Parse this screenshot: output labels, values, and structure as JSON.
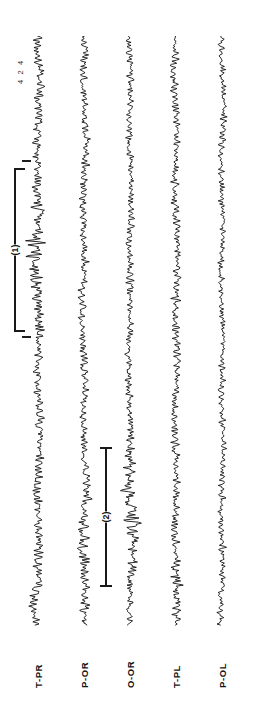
{
  "figure": {
    "name": "polygraphic-eeg-recording",
    "orientation_degrees": 90,
    "background_color": "#ffffff",
    "trace_color": "#121212",
    "annotation_color": "#191919"
  },
  "scale_caption": {
    "text": "4 2 4"
  },
  "channels": [
    {
      "id": "ch1",
      "label": "T-PR",
      "x": 38,
      "seed": 11
    },
    {
      "id": "ch2",
      "label": "P-OR",
      "x": 84,
      "seed": 27
    },
    {
      "id": "ch3",
      "label": "O-OR",
      "x": 130,
      "seed": 43
    },
    {
      "id": "ch4",
      "label": "T-PL",
      "x": 176,
      "seed": 59
    },
    {
      "id": "ch5",
      "label": "P-OL",
      "x": 222,
      "seed": 73
    }
  ],
  "annotations": [
    {
      "id": "m1",
      "text": "(1)",
      "style": "bracket",
      "x": 14,
      "y": 168,
      "length": 164
    },
    {
      "id": "m2",
      "text": "(2)",
      "style": "ibeam",
      "x": 100,
      "y": 447,
      "length": 140
    }
  ],
  "tick_marks": [
    {
      "id": "t1",
      "x": 22,
      "y": 160,
      "width": 9
    },
    {
      "id": "t2",
      "x": 22,
      "y": 336,
      "width": 9
    }
  ],
  "chart_data": {
    "type": "line",
    "title": "",
    "subtitle": "",
    "xlabel": "",
    "ylabel": "",
    "legend_position": "none",
    "grid": false,
    "orientation": "vertical-time-axis",
    "amplitude_scale_label": "4 2 4",
    "series": [
      {
        "name": "T-PR",
        "baseline_x": 38,
        "noise_amplitude": 7.5,
        "burst_regions": [
          {
            "start": 168,
            "end": 332,
            "amplitude": 13,
            "annotation": "(1)"
          },
          {
            "start": 560,
            "end": 624,
            "amplitude": 11
          }
        ],
        "values": [
          0,
          2,
          -3,
          4,
          -2,
          5,
          -4,
          3,
          -5,
          6,
          -3,
          2,
          -4,
          5,
          -6,
          3,
          -2,
          4,
          -5,
          6,
          -4,
          3,
          -6,
          5,
          -3,
          4,
          -2,
          6,
          -5,
          3
        ]
      },
      {
        "name": "P-OR",
        "baseline_x": 84,
        "noise_amplitude": 7,
        "burst_regions": [
          {
            "start": 470,
            "end": 610,
            "amplitude": 10
          }
        ],
        "values": [
          1,
          -3,
          5,
          -2,
          4,
          -6,
          3,
          -4,
          6,
          -2,
          5,
          -3,
          4,
          -5,
          2,
          -6,
          4,
          -3,
          5,
          -4,
          3,
          -5,
          6,
          -2,
          4,
          -6,
          3,
          -4,
          5,
          -3
        ]
      },
      {
        "name": "O-OR",
        "baseline_x": 130,
        "noise_amplitude": 6,
        "burst_regions": [
          {
            "start": 447,
            "end": 587,
            "amplitude": 14,
            "annotation": "(2)"
          }
        ],
        "values": [
          -2,
          4,
          -5,
          3,
          -6,
          2,
          -4,
          5,
          -3,
          6,
          -2,
          4,
          -6,
          3,
          -5,
          2,
          -4,
          6,
          -3,
          5,
          -2,
          4,
          -6,
          3,
          -4,
          5,
          -2,
          6,
          -3,
          4
        ]
      },
      {
        "name": "T-PL",
        "baseline_x": 176,
        "noise_amplitude": 6.5,
        "burst_regions": [
          {
            "start": 556,
            "end": 600,
            "amplitude": 10
          }
        ],
        "values": [
          3,
          -4,
          2,
          -5,
          6,
          -3,
          4,
          -2,
          5,
          -6,
          3,
          -4,
          6,
          -2,
          4,
          -5,
          3,
          -6,
          2,
          -4,
          5,
          -3,
          6,
          -2,
          4,
          -5,
          3,
          -4,
          6,
          -2
        ]
      },
      {
        "name": "P-OL",
        "baseline_x": 222,
        "noise_amplitude": 5.5,
        "burst_regions": [],
        "values": [
          -1,
          3,
          -4,
          5,
          -2,
          6,
          -3,
          4,
          -5,
          2,
          -6,
          3,
          -4,
          5,
          -3,
          6,
          -2,
          4,
          -5,
          3,
          -6,
          2,
          -4,
          5,
          -3,
          4,
          -6,
          2,
          -5,
          3
        ]
      }
    ]
  }
}
